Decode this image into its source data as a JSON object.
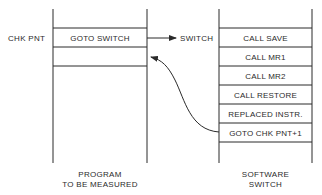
{
  "diagram": {
    "left_column": {
      "row_label": "CHK PNT",
      "cells": [
        "GOTO SWITCH",
        "",
        ""
      ],
      "caption_line1": "PROGRAM",
      "caption_line2": "TO BE MEASURED"
    },
    "right_column": {
      "entry_label": "SWITCH",
      "cells": [
        "CALL SAVE",
        "CALL MR1",
        "CALL MR2",
        "CALL RESTORE",
        "REPLACED INSTR.",
        "GOTO CHK PNT+1"
      ],
      "caption_line1": "SOFTWARE",
      "caption_line2": "SWITCH"
    },
    "arrows": [
      {
        "from": "GOTO SWITCH",
        "to": "SWITCH",
        "style": "straight"
      },
      {
        "from": "GOTO CHK PNT+1",
        "to": "left row after CHK PNT",
        "style": "curved"
      }
    ],
    "colors": {
      "line": "#2a2a2a",
      "text": "#2b2b2b",
      "background": "#ffffff"
    }
  }
}
